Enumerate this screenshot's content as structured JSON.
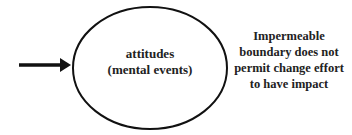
{
  "diagram": {
    "ellipse": {
      "line1": "attitudes",
      "line2": "(mental events)"
    },
    "note": "Impermeable boundary does not permit change effort to have impact",
    "colors": {
      "stroke": "#111111",
      "text": "#222222",
      "background": "#ffffff"
    }
  }
}
